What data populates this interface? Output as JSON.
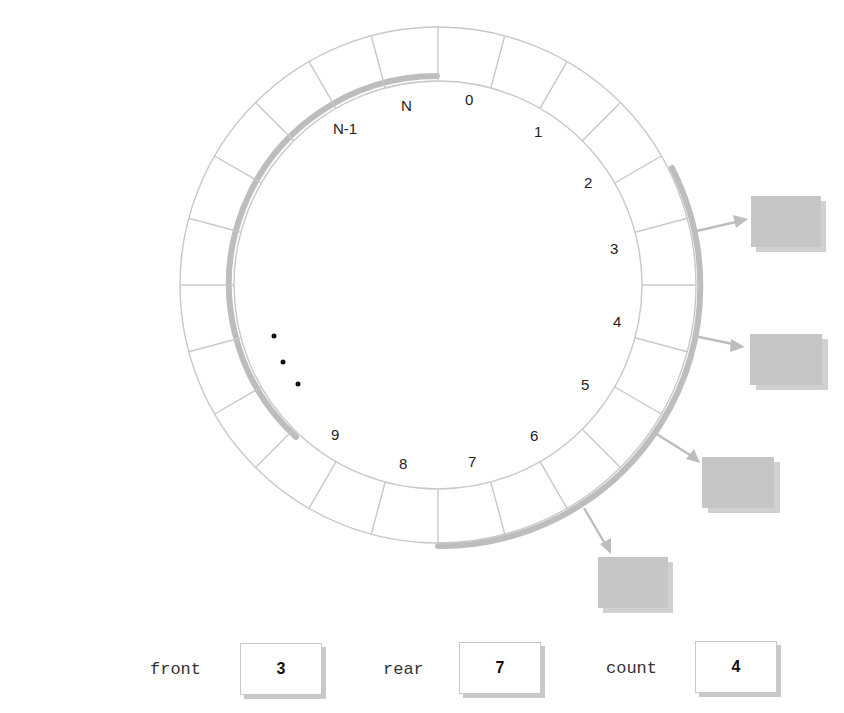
{
  "diagram": {
    "slot_labels": [
      "N",
      "0",
      "1",
      "2",
      "3",
      "4",
      "5",
      "6",
      "7",
      "8",
      "9",
      "N-1"
    ],
    "ellipsis": "...",
    "occupied_slots": [
      3,
      4,
      5,
      6
    ],
    "colors": {
      "ring_stroke": "#c8c8c8",
      "occupied_arc": "#bdbdbd",
      "element_fill": "#c6c6c6",
      "arrow": "#bdbdbd",
      "text": "#222222"
    }
  },
  "variables": {
    "front": {
      "label": "front",
      "value": "3"
    },
    "rear": {
      "label": "rear",
      "value": "7"
    },
    "count": {
      "label": "count",
      "value": "4"
    }
  }
}
